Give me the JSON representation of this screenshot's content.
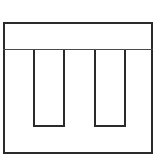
{
  "diagram": {
    "type": "line-drawing",
    "stroke_color": "#2a2a2a",
    "divider_color": "#4a4a4a",
    "background_color": "#ffffff",
    "frame": {
      "x": 3,
      "y": 22,
      "width": 150,
      "height": 132
    },
    "divider_y": 49,
    "slots": [
      {
        "id": "slot-1",
        "x": 33,
        "y": 50,
        "width": 32,
        "height": 77
      },
      {
        "id": "slot-2",
        "x": 94,
        "y": 50,
        "width": 32,
        "height": 77
      }
    ]
  }
}
